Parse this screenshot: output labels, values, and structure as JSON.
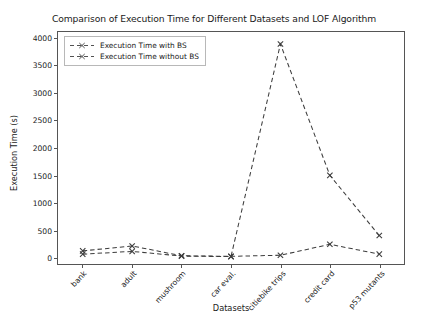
{
  "chart_data": {
    "type": "line",
    "title": "Comparison of Execution Time for Different Datasets and LOF Algorithm",
    "xlabel": "Datasets",
    "ylabel": "Execution Time (s)",
    "categories": [
      "bank",
      "adult",
      "mushroom",
      "car eval.",
      "citiebike trips",
      "credit card",
      "p53 mutants"
    ],
    "series": [
      {
        "name": "Execution Time with BS",
        "values": [
          120,
          210,
          30,
          20,
          40,
          240,
          60
        ],
        "marker": "x",
        "linestyle": "dashed",
        "color": "#3d3d3d"
      },
      {
        "name": "Execution Time without BS",
        "values": [
          60,
          110,
          25,
          15,
          3900,
          1500,
          400
        ],
        "marker": "x",
        "linestyle": "dashed",
        "color": "#3d3d3d"
      }
    ],
    "ylim": [
      -120,
      4120
    ],
    "yticks": [
      0,
      500,
      1000,
      1500,
      2000,
      2500,
      3000,
      3500,
      4000
    ],
    "ytick_labels": [
      "0",
      "500",
      "1000",
      "1500",
      "2000",
      "2500",
      "3000",
      "3500",
      "4000"
    ],
    "grid": false,
    "legend_position": "upper left",
    "legend_entries": [
      "Execution Time with BS",
      "Execution Time without BS"
    ]
  }
}
